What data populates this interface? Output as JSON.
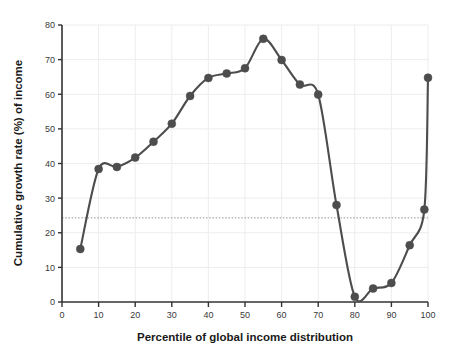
{
  "chart_data": {
    "type": "line",
    "title": "",
    "subtitle": "",
    "xlabel": "Percentile of global income distribution",
    "ylabel": "Cumulative growth rate (%) of income",
    "xlim": [
      0,
      100
    ],
    "ylim": [
      0,
      80
    ],
    "xticks": [
      0,
      10,
      20,
      30,
      40,
      50,
      60,
      70,
      80,
      90,
      100
    ],
    "yticks": [
      0,
      10,
      20,
      30,
      40,
      50,
      60,
      70,
      80
    ],
    "xtick_labels": [
      "0",
      "10",
      "20",
      "30",
      "40",
      "50",
      "60",
      "70",
      "80",
      "90",
      "100"
    ],
    "ytick_labels": [
      "0",
      "10",
      "20",
      "30",
      "40",
      "50",
      "60",
      "70",
      "80"
    ],
    "grid": true,
    "grid_color": "#ededed",
    "legend": null,
    "legend_position": "none",
    "series": [
      {
        "name": "Cumulative growth rate",
        "marker": "circle",
        "color": "#4d4d4d",
        "line_color": "#4d4d4d",
        "x": [
          5,
          10,
          15,
          20,
          25,
          30,
          35,
          40,
          45,
          50,
          55,
          60,
          65,
          70,
          75,
          80,
          85,
          90,
          95,
          99,
          100
        ],
        "values": [
          15.3,
          38.4,
          39.0,
          41.7,
          46.3,
          51.5,
          59.5,
          64.7,
          66.0,
          67.5,
          76.0,
          69.9,
          62.8,
          59.9,
          28.0,
          1.5,
          3.9,
          5.5,
          16.4,
          26.7,
          64.8
        ]
      }
    ],
    "annotations": [
      {
        "name": "global-mean-reference-line",
        "type": "horizontal-dashed-line",
        "value": 24.3,
        "color": "#9a9a9a",
        "label": ""
      }
    ]
  }
}
